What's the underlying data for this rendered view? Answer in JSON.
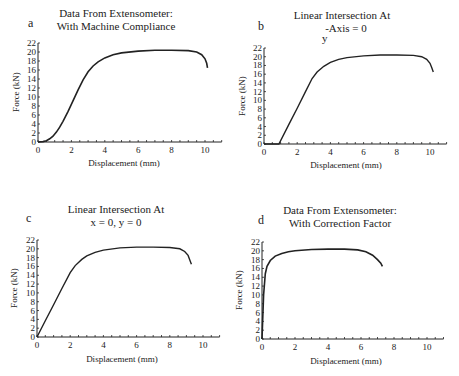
{
  "chart_data": [
    {
      "panel": "a",
      "type": "line",
      "title": "Data From Extensometer:",
      "subtitle": "With Machine Compliance",
      "xlabel": "Displacement (mm)",
      "ylabel": "Force (kN)",
      "xlim": [
        0,
        11
      ],
      "ylim": [
        0,
        22
      ],
      "xticks": [
        0,
        2,
        4,
        6,
        8,
        10
      ],
      "yticks": [
        0,
        2,
        4,
        6,
        8,
        10,
        12,
        14,
        16,
        18,
        20,
        22
      ],
      "grid": false,
      "series": [
        {
          "name": "Force-Displacement",
          "x": [
            0,
            0.3,
            0.5,
            0.7,
            0.9,
            1.1,
            1.3,
            1.5,
            1.8,
            2.1,
            2.4,
            2.7,
            3.0,
            3.3,
            3.6,
            4.0,
            4.5,
            5.0,
            6.0,
            7.0,
            8.0,
            9.0,
            9.5,
            9.8,
            10.0,
            10.1,
            10.15
          ],
          "y": [
            0,
            0.1,
            0.3,
            0.7,
            1.3,
            2.2,
            3.3,
            4.6,
            6.8,
            9.2,
            11.6,
            13.8,
            15.6,
            16.9,
            17.8,
            18.7,
            19.4,
            19.8,
            20.2,
            20.4,
            20.4,
            20.3,
            20.0,
            19.4,
            18.5,
            17.5,
            16.5
          ]
        }
      ]
    },
    {
      "panel": "b",
      "type": "line",
      "title": "Linear Intersection At",
      "subtitle": "-Axis = 0",
      "subtitle_prefix": "y",
      "xlabel": "Displacement (mm)",
      "ylabel": "Force (kN)",
      "xlim": [
        0,
        11
      ],
      "ylim": [
        0,
        22
      ],
      "xticks": [
        0,
        2,
        4,
        6,
        8,
        10
      ],
      "yticks": [
        0,
        2,
        4,
        6,
        8,
        10,
        12,
        14,
        16,
        18,
        20,
        22
      ],
      "grid": false,
      "series": [
        {
          "name": "Force-Displacement",
          "x": [
            0,
            0.9,
            1.5,
            2.0,
            2.5,
            2.9,
            3.2,
            3.6,
            4.0,
            4.5,
            5.0,
            6.0,
            7.0,
            8.0,
            9.0,
            9.5,
            9.8,
            10.0,
            10.1,
            10.2
          ],
          "y": [
            0,
            0,
            4.5,
            8.2,
            12.0,
            15.0,
            16.5,
            17.8,
            18.7,
            19.4,
            19.8,
            20.2,
            20.4,
            20.4,
            20.3,
            20.0,
            19.4,
            18.5,
            17.5,
            16.5
          ]
        }
      ]
    },
    {
      "panel": "c",
      "type": "line",
      "title": "Linear Intersection At",
      "subtitle": "x = 0, y = 0",
      "xlabel": "Displacement (mm)",
      "ylabel": "Force (kN)",
      "xlim": [
        0,
        11
      ],
      "ylim": [
        0,
        22
      ],
      "xticks": [
        0,
        2,
        4,
        6,
        8,
        10
      ],
      "yticks": [
        0,
        2,
        4,
        6,
        8,
        10,
        12,
        14,
        16,
        18,
        20,
        22
      ],
      "grid": false,
      "series": [
        {
          "name": "Force-Displacement",
          "x": [
            0,
            0.5,
            1.0,
            1.5,
            2.0,
            2.3,
            2.7,
            3.0,
            3.5,
            4.0,
            5.0,
            6.0,
            7.0,
            8.0,
            8.6,
            8.9,
            9.1,
            9.2,
            9.3
          ],
          "y": [
            0,
            3.7,
            7.3,
            11.0,
            14.6,
            16.2,
            17.6,
            18.4,
            19.2,
            19.7,
            20.2,
            20.4,
            20.4,
            20.3,
            20.0,
            19.4,
            18.5,
            17.5,
            16.5
          ]
        }
      ]
    },
    {
      "panel": "d",
      "type": "line",
      "title": "Data From Extensometer:",
      "subtitle": "With Correction Factor",
      "xlabel": "Displacement (mm)",
      "ylabel": "Force (kN)",
      "xlim": [
        0,
        11
      ],
      "ylim": [
        0,
        22
      ],
      "xticks": [
        0,
        2,
        4,
        6,
        8,
        10
      ],
      "yticks": [
        0,
        2,
        4,
        6,
        8,
        10,
        12,
        14,
        16,
        18,
        20,
        22
      ],
      "grid": false,
      "series": [
        {
          "name": "Force-Displacement",
          "x": [
            0,
            0.1,
            0.2,
            0.3,
            0.5,
            0.8,
            1.2,
            1.6,
            2.0,
            3.0,
            4.0,
            5.0,
            5.8,
            6.3,
            6.7,
            7.0,
            7.2,
            7.3
          ],
          "y": [
            0,
            10.0,
            14.8,
            16.5,
            17.8,
            18.8,
            19.4,
            19.8,
            20.0,
            20.3,
            20.4,
            20.4,
            20.2,
            19.8,
            19.0,
            18.0,
            17.2,
            16.5
          ]
        }
      ]
    }
  ]
}
